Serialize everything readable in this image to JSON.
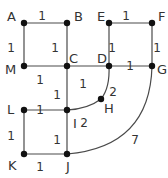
{
  "diagram": {
    "type": "weighted-graph",
    "colors": {
      "edge": "#4a4a4a",
      "node": "#111111",
      "text": "#333333",
      "background": "#ffffff"
    },
    "nodes": [
      {
        "id": "A",
        "x": 24,
        "y": 23,
        "lx": 7,
        "ly": 21
      },
      {
        "id": "B",
        "x": 67,
        "y": 23,
        "lx": 74,
        "ly": 21
      },
      {
        "id": "E",
        "x": 109,
        "y": 23,
        "lx": 97,
        "ly": 21
      },
      {
        "id": "F",
        "x": 152,
        "y": 23,
        "lx": 158,
        "ly": 21
      },
      {
        "id": "M",
        "x": 24,
        "y": 66,
        "lx": 5,
        "ly": 74
      },
      {
        "id": "C",
        "x": 67,
        "y": 66,
        "lx": 69,
        "ly": 63
      },
      {
        "id": "D",
        "x": 109,
        "y": 66,
        "lx": 97,
        "ly": 63
      },
      {
        "id": "G",
        "x": 152,
        "y": 66,
        "lx": 157,
        "ly": 74
      },
      {
        "id": "H",
        "x": 101,
        "y": 99,
        "lx": 104,
        "ly": 113
      },
      {
        "id": "L",
        "x": 24,
        "y": 110,
        "lx": 7,
        "ly": 114
      },
      {
        "id": "I",
        "x": 67,
        "y": 110,
        "lx": 73,
        "ly": 128
      },
      {
        "id": "K",
        "x": 24,
        "y": 154,
        "lx": 8,
        "ly": 170
      },
      {
        "id": "J",
        "x": 67,
        "y": 154,
        "lx": 66,
        "ly": 171
      }
    ],
    "edges": [
      {
        "from": "A",
        "to": "B",
        "weight": "1",
        "wx": 42,
        "wy": 16
      },
      {
        "from": "A",
        "to": "M",
        "weight": "1",
        "wx": 11,
        "wy": 48
      },
      {
        "from": "B",
        "to": "C",
        "weight": "1",
        "wx": 55,
        "wy": 48
      },
      {
        "from": "M",
        "to": "C",
        "weight": "1",
        "wx": 40,
        "wy": 80
      },
      {
        "from": "C",
        "to": "D",
        "weight": "1",
        "wx": 83,
        "wy": 84
      },
      {
        "from": "E",
        "to": "F",
        "weight": "1",
        "wx": 126,
        "wy": 16
      },
      {
        "from": "E",
        "to": "D",
        "weight": "1",
        "wx": 112,
        "wy": 48
      },
      {
        "from": "F",
        "to": "G",
        "weight": "1",
        "wx": 157,
        "wy": 48
      },
      {
        "from": "D",
        "to": "G",
        "weight": "1",
        "wx": 130,
        "wy": 66
      },
      {
        "from": "C",
        "to": "I",
        "weight": "1",
        "wx": 57,
        "wy": 95
      },
      {
        "from": "L",
        "to": "I",
        "weight": "1",
        "wx": 40,
        "wy": 110
      },
      {
        "from": "L",
        "to": "K",
        "weight": "1",
        "wx": 11,
        "wy": 136
      },
      {
        "from": "I",
        "to": "J",
        "weight": "1",
        "wx": 57,
        "wy": 140
      },
      {
        "from": "K",
        "to": "J",
        "weight": "1",
        "wx": 40,
        "wy": 167
      },
      {
        "from": "D",
        "to": "H",
        "weight": "2",
        "wx": 113,
        "wy": 92,
        "path": "M109,66 Q110,88 101,99"
      },
      {
        "from": "H",
        "to": "I",
        "weight": "2",
        "wx": 84,
        "wy": 123,
        "path": "M101,99 Q88,109 67,110"
      },
      {
        "from": "G",
        "to": "J",
        "weight": "7",
        "wx": 135,
        "wy": 140,
        "path": "M152,66 Q150,147 67,154"
      }
    ]
  }
}
